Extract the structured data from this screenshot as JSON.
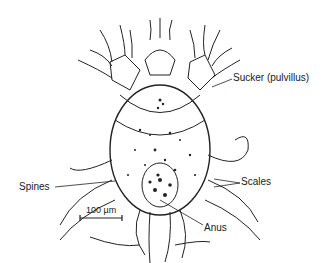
{
  "figure": {
    "labels": {
      "sucker": "Sucker (pulvillus)",
      "scales": "Scales",
      "spines": "Spines",
      "anus": "Anus",
      "scale_bar": "100 µm"
    }
  }
}
